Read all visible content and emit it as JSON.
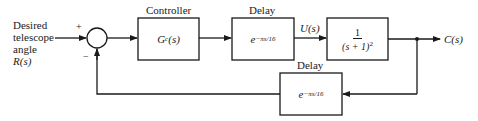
{
  "diagram": {
    "type": "block-diagram",
    "input": {
      "label_lines": [
        "Desired",
        "telescope",
        "angle",
        "R(s)"
      ]
    },
    "summing_junction": {
      "plus_sign": "+",
      "minus_sign": "−"
    },
    "blocks": [
      {
        "id": "controller",
        "title": "Controller",
        "content": "G_c(s)",
        "display_main": "G",
        "display_sub": "c",
        "display_tail": "(s)"
      },
      {
        "id": "forward-delay",
        "title": "Delay",
        "content": "e^{-πs/16}",
        "display_base": "e",
        "display_exp": "−πs/16"
      },
      {
        "id": "plant",
        "title": "",
        "content": "1/(s+1)^2",
        "numerator": "1",
        "denominator": "(s + 1)",
        "den_exp": "2"
      },
      {
        "id": "feedback-delay",
        "title": "Delay",
        "content": "e^{-πs/16}",
        "display_base": "e",
        "display_exp": "−πs/16"
      }
    ],
    "signals": {
      "u": "U(s)",
      "output": "C(s)"
    },
    "colors": {
      "line": "#1a1a1a",
      "background": "#ffffff"
    }
  }
}
